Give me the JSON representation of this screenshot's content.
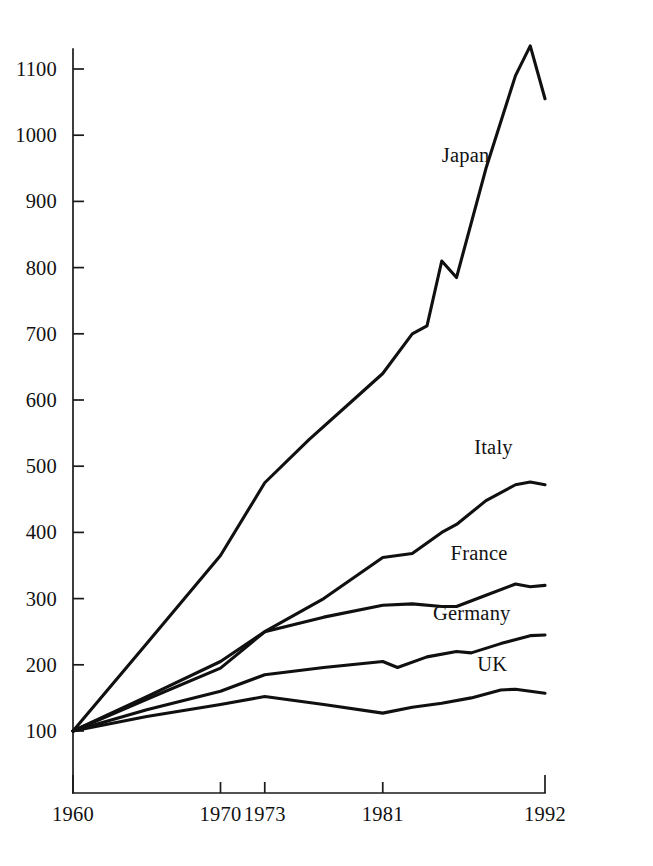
{
  "chart_data": {
    "type": "line",
    "title": "",
    "subtitle": "",
    "xlabel": "",
    "ylabel": "",
    "xlim": [
      1960,
      1992
    ],
    "ylim": [
      100,
      1100
    ],
    "grid": false,
    "legend_position": "inline-right",
    "note": "Index, 1960 = 100",
    "x_ticks": [
      "1960",
      "1970",
      "1973",
      "1981",
      "1992"
    ],
    "x_tick_values": [
      1960,
      1970,
      1973,
      1981,
      1992
    ],
    "y_ticks": [
      "100",
      "200",
      "300",
      "400",
      "500",
      "600",
      "700",
      "800",
      "900",
      "1000",
      "1100"
    ],
    "y_tick_values": [
      100,
      200,
      300,
      400,
      500,
      600,
      700,
      800,
      900,
      1000,
      1100
    ],
    "series": [
      {
        "name": "Japan",
        "label": "Japan",
        "label_x": 1985.0,
        "label_y": 960,
        "color": "#101010",
        "x": [
          1960,
          1965,
          1970,
          1973,
          1976,
          1979,
          1981,
          1983,
          1984,
          1985,
          1986,
          1988,
          1990,
          1991,
          1992
        ],
        "values": [
          100,
          232,
          365,
          475,
          540,
          600,
          640,
          700,
          712,
          810,
          785,
          950,
          1090,
          1135,
          1055
        ]
      },
      {
        "name": "Italy",
        "label": "Italy",
        "label_x": 1987.2,
        "label_y": 518,
        "color": "#101010",
        "x": [
          1960,
          1965,
          1970,
          1973,
          1977,
          1981,
          1983,
          1985,
          1986,
          1988,
          1990,
          1991,
          1992
        ],
        "values": [
          100,
          152,
          205,
          250,
          300,
          362,
          368,
          400,
          412,
          448,
          472,
          476,
          472
        ]
      },
      {
        "name": "France",
        "label": "France",
        "label_x": 1985.6,
        "label_y": 358,
        "color": "#101010",
        "x": [
          1960,
          1965,
          1970,
          1973,
          1977,
          1981,
          1983,
          1985,
          1986,
          1988,
          1990,
          1991,
          1992
        ],
        "values": [
          100,
          148,
          195,
          250,
          272,
          290,
          292,
          288,
          288,
          305,
          322,
          318,
          320
        ]
      },
      {
        "name": "Germany",
        "label": "Germany",
        "label_x": 1984.4,
        "label_y": 268,
        "color": "#101010",
        "x": [
          1960,
          1965,
          1970,
          1973,
          1977,
          1981,
          1982,
          1984,
          1986,
          1987,
          1989,
          1991,
          1992
        ],
        "values": [
          100,
          132,
          160,
          185,
          196,
          205,
          196,
          212,
          220,
          218,
          232,
          244,
          245
        ]
      },
      {
        "name": "UK",
        "label": "UK",
        "label_x": 1987.4,
        "label_y": 190,
        "color": "#101010",
        "x": [
          1960,
          1965,
          1970,
          1973,
          1977,
          1981,
          1983,
          1985,
          1987,
          1989,
          1990,
          1991,
          1992
        ],
        "values": [
          100,
          122,
          140,
          152,
          140,
          127,
          136,
          142,
          150,
          162,
          163,
          160,
          157
        ]
      }
    ]
  },
  "axes": {
    "y_axis_name": "index-value-axis",
    "x_axis_name": "year-axis"
  }
}
